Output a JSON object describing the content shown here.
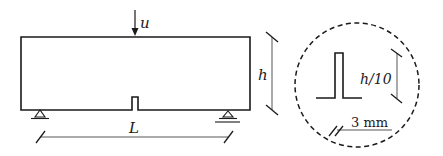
{
  "figure": {
    "type": "beam-schematic",
    "colors": {
      "stroke": "#1a1a1a",
      "dim_line": "#444444",
      "background": "#ffffff"
    }
  },
  "beam": {
    "load_label": "u",
    "span_label": "L",
    "height_label": "h"
  },
  "detail": {
    "notch_depth_label": "h/10",
    "notch_width_label": "3 mm"
  }
}
